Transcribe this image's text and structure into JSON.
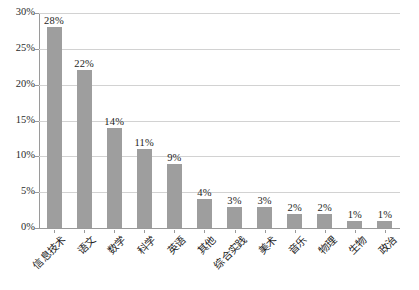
{
  "chart_data": {
    "type": "bar",
    "title": "",
    "subtitle": "",
    "xlabel": "",
    "ylabel": "",
    "ylim": [
      0,
      30
    ],
    "ytick_step": 5,
    "ytick_labels": [
      "0%",
      "5%",
      "10%",
      "15%",
      "20%",
      "25%",
      "30%"
    ],
    "ytick_values": [
      0,
      5,
      10,
      15,
      20,
      25,
      30
    ],
    "grid": true,
    "legend": false,
    "legend_position": "none",
    "value_suffix": "%",
    "bar_color": "#9e9e9e",
    "gridline_color": "#d2d2d2",
    "axis_color": "#9a9a9a",
    "text_color": "#1d1d1d",
    "categories": [
      "信息技术",
      "语文",
      "数学",
      "科学",
      "英语",
      "其他",
      "综合实践",
      "美术",
      "音乐",
      "物理",
      "生物",
      "政治"
    ],
    "values": [
      28,
      22,
      14,
      11,
      9,
      4,
      3,
      3,
      2,
      2,
      1,
      1
    ],
    "data_labels": [
      "28%",
      "22%",
      "14%",
      "11%",
      "9%",
      "4%",
      "3%",
      "3%",
      "2%",
      "2%",
      "1%",
      "1%"
    ]
  }
}
